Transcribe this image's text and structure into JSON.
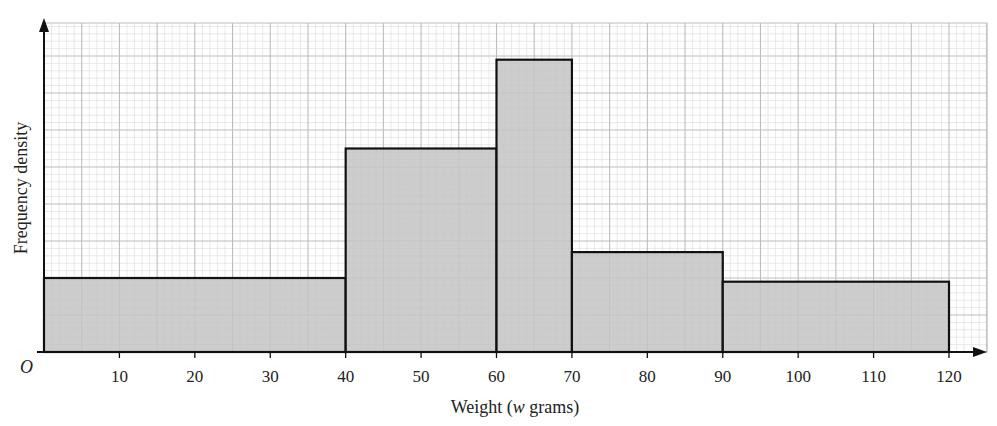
{
  "chart_data": {
    "type": "bar",
    "subtype": "histogram",
    "title": "",
    "xlabel": "Weight (w grams)",
    "xlabel_parts": {
      "prefix": "Weight (",
      "italic": "w",
      "suffix": " grams)"
    },
    "ylabel": "Frequency density",
    "origin_label": "O",
    "x_ticks": [
      10,
      20,
      30,
      40,
      50,
      60,
      70,
      80,
      90,
      100,
      110,
      120
    ],
    "xlim": [
      0,
      125
    ],
    "y_ticks": [],
    "y_units_note": "y-axis unlabelled; values are heights in large grid squares (1 large square = 5 small squares)",
    "ylim": [
      0,
      8.9
    ],
    "grid": true,
    "bins": [
      {
        "from": 0,
        "to": 40,
        "height": 2.0
      },
      {
        "from": 40,
        "to": 60,
        "height": 5.5
      },
      {
        "from": 60,
        "to": 70,
        "height": 7.9
      },
      {
        "from": 70,
        "to": 90,
        "height": 2.7
      },
      {
        "from": 90,
        "to": 120,
        "height": 1.9
      }
    ],
    "categories": [
      "0-40",
      "40-60",
      "60-70",
      "70-90",
      "90-120"
    ],
    "values": [
      2.0,
      5.5,
      7.9,
      2.7,
      1.9
    ],
    "colors": {
      "bar_fill": "#c4c4c4",
      "bar_edge": "#111111",
      "grid_major": "#bdbdbd",
      "grid_minor": "#e0e0e0",
      "axis": "#111111"
    }
  }
}
